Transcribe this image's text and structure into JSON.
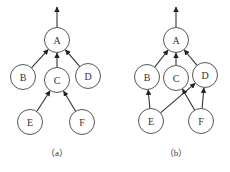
{
  "diagrams": [
    {
      "caption": "（a）",
      "nodes": [
        {
          "id": "A",
          "label": "A",
          "x": 57,
          "y": 40
        },
        {
          "id": "B",
          "label": "B",
          "x": 23,
          "y": 77
        },
        {
          "id": "C",
          "label": "C",
          "x": 57,
          "y": 80
        },
        {
          "id": "D",
          "label": "D",
          "x": 88,
          "y": 76
        },
        {
          "id": "E",
          "label": "E",
          "x": 30,
          "y": 122
        },
        {
          "id": "F",
          "label": "F",
          "x": 82,
          "y": 122
        }
      ],
      "edges": [
        {
          "from": "B",
          "to": "A"
        },
        {
          "from": "C",
          "to": "A"
        },
        {
          "from": "D",
          "to": "A"
        },
        {
          "from": "E",
          "to": "C"
        },
        {
          "from": "F",
          "to": "C"
        }
      ],
      "output_arrow_from": "A"
    },
    {
      "caption": "（b）",
      "nodes": [
        {
          "id": "A",
          "label": "A",
          "x": 176,
          "y": 40
        },
        {
          "id": "B",
          "label": "B",
          "x": 147,
          "y": 77
        },
        {
          "id": "C",
          "label": "C",
          "x": 176,
          "y": 78
        },
        {
          "id": "D",
          "label": "D",
          "x": 205,
          "y": 75
        },
        {
          "id": "E",
          "label": "E",
          "x": 151,
          "y": 121
        },
        {
          "id": "F",
          "label": "F",
          "x": 201,
          "y": 121
        }
      ],
      "edges": [
        {
          "from": "B",
          "to": "A"
        },
        {
          "from": "C",
          "to": "A"
        },
        {
          "from": "D",
          "to": "A"
        },
        {
          "from": "E",
          "to": "B"
        },
        {
          "from": "E",
          "to": "D"
        },
        {
          "from": "F",
          "to": "C"
        },
        {
          "from": "F",
          "to": "D"
        }
      ],
      "output_arrow_from": "A"
    }
  ],
  "node_radius": 12.5
}
